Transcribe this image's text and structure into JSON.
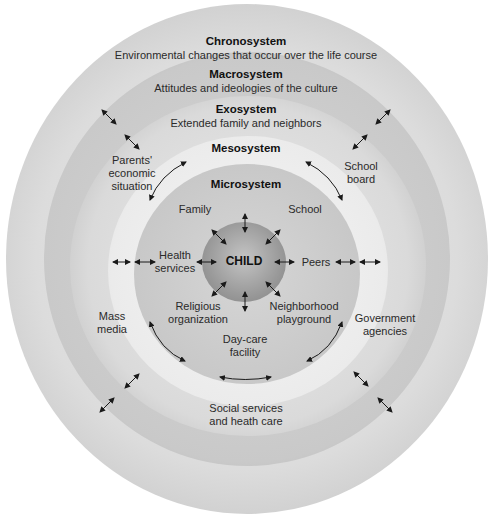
{
  "systems": {
    "chronosystem": {
      "title": "Chronosystem",
      "description": "Environmental changes that occur over the life course"
    },
    "macrosystem": {
      "title": "Macrosystem",
      "description": "Attitudes and ideologies of the culture"
    },
    "exosystem": {
      "title": "Exosystem",
      "description": "Extended family and neighbors"
    },
    "mesosystem": {
      "title": "Mesosystem"
    },
    "microsystem": {
      "title": "Microsystem"
    },
    "center": {
      "label": "CHILD"
    }
  },
  "microsystem_items": {
    "family": "Family",
    "school": "School",
    "health_services": [
      "Health",
      "services"
    ],
    "peers": "Peers",
    "religious": [
      "Religious",
      "organization"
    ],
    "neighborhood": [
      "Neighborhood",
      "playground"
    ],
    "daycare": [
      "Day-care",
      "facility"
    ]
  },
  "exosystem_items": {
    "parents_economic": [
      "Parents'",
      "economic",
      "situation"
    ],
    "school_board": [
      "School",
      "board"
    ],
    "mass_media": [
      "Mass",
      "media"
    ],
    "government": [
      "Government",
      "agencies"
    ],
    "social_services": [
      "Social services",
      "and heath care"
    ]
  },
  "colors": {
    "background": "#ffffff",
    "chronosystem_ring": "#dcdcdc",
    "macrosystem_ring": "#c9c9c9",
    "exosystem_ring": "#dadada",
    "mesosystem_ring": "#ebebeb",
    "microsystem_ring": "#c7c7c7",
    "child_core": "#9a9a9a",
    "arrow": "#1a1a1a"
  }
}
